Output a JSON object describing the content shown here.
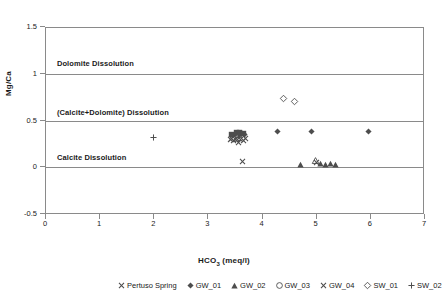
{
  "chart_data": {
    "type": "scatter",
    "title": "",
    "xlabel": "HCO3 (meq/l)",
    "xlabel_base": "HCO",
    "xlabel_sub": "3",
    "xlabel_unit": " (meq/l)",
    "ylabel": "Mg/Ca",
    "xlim": [
      0,
      7
    ],
    "ylim": [
      -0.5,
      1.5
    ],
    "xticks": [
      0,
      1,
      2,
      3,
      4,
      5,
      6,
      7
    ],
    "yticks": [
      -0.5,
      0,
      0.5,
      1,
      1.5
    ],
    "xtick_labels": [
      "0",
      "1",
      "2",
      "3",
      "4",
      "5",
      "6",
      "7"
    ],
    "ytick_labels": [
      "-0.5",
      "0",
      "0.5",
      "1",
      "1.5"
    ],
    "grid": false,
    "reference_lines": [
      {
        "name": "calcite-line",
        "y": 0
      },
      {
        "name": "calcite-dolomite-line",
        "y": 0.5
      },
      {
        "name": "dolomite-line",
        "y": 1.0
      }
    ],
    "annotations": [
      {
        "name": "dolomite-dissolution-label",
        "text": "Dolomite Dissolution",
        "x": 0.22,
        "y": 1.1
      },
      {
        "name": "calcite-dolomite-dissolution-label",
        "text": "(Calcite+Dolomite) Dissolution",
        "x": 0.22,
        "y": 0.58
      },
      {
        "name": "calcite-dissolution-label",
        "text": "Calcite Dissolution",
        "x": 0.22,
        "y": 0.1
      }
    ],
    "legend_position": "bottom",
    "series": [
      {
        "name": "Pertuso Spring",
        "marker": "x",
        "points": [
          {
            "x": 3.42,
            "y": 0.3
          },
          {
            "x": 3.48,
            "y": 0.285
          },
          {
            "x": 3.55,
            "y": 0.295
          },
          {
            "x": 3.58,
            "y": 0.27
          },
          {
            "x": 3.62,
            "y": 0.3
          },
          {
            "x": 3.66,
            "y": 0.285
          },
          {
            "x": 3.64,
            "y": 0.06
          },
          {
            "x": 5.02,
            "y": 0.055
          }
        ]
      },
      {
        "name": "GW_01",
        "marker": "diamond-filled",
        "points": [
          {
            "x": 3.5,
            "y": 0.35
          },
          {
            "x": 3.6,
            "y": 0.345
          },
          {
            "x": 3.68,
            "y": 0.355
          },
          {
            "x": 4.3,
            "y": 0.38
          },
          {
            "x": 4.92,
            "y": 0.38
          },
          {
            "x": 5.98,
            "y": 0.38
          }
        ]
      },
      {
        "name": "GW_02",
        "marker": "triangle-filled",
        "points": [
          {
            "x": 4.72,
            "y": 0.03
          },
          {
            "x": 5.08,
            "y": 0.035
          },
          {
            "x": 5.18,
            "y": 0.03
          },
          {
            "x": 5.28,
            "y": 0.035
          },
          {
            "x": 5.36,
            "y": 0.03
          }
        ]
      },
      {
        "name": "GW_03",
        "marker": "circle-open",
        "points": [
          {
            "x": 3.56,
            "y": 0.365
          },
          {
            "x": 3.62,
            "y": 0.36
          }
        ]
      },
      {
        "name": "GW_04",
        "marker": "x",
        "points": [
          {
            "x": 3.45,
            "y": 0.31
          },
          {
            "x": 3.52,
            "y": 0.3
          },
          {
            "x": 3.7,
            "y": 0.305
          }
        ]
      },
      {
        "name": "SW_01",
        "marker": "diamond-open",
        "points": [
          {
            "x": 4.41,
            "y": 0.73
          },
          {
            "x": 4.6,
            "y": 0.7
          }
        ]
      },
      {
        "name": "SW_02",
        "marker": "plus",
        "points": [
          {
            "x": 2.0,
            "y": 0.32
          },
          {
            "x": 3.57,
            "y": 0.355
          }
        ]
      },
      {
        "name": "SW_03",
        "marker": "square-filled",
        "points": [
          {
            "x": 3.44,
            "y": 0.355
          },
          {
            "x": 3.53,
            "y": 0.375
          },
          {
            "x": 3.59,
            "y": 0.375
          },
          {
            "x": 3.66,
            "y": 0.36
          }
        ]
      },
      {
        "name": "SW_04",
        "marker": "triangle-open",
        "points": [
          {
            "x": 3.57,
            "y": 0.345
          },
          {
            "x": 5.0,
            "y": 0.07
          }
        ]
      }
    ],
    "legend": [
      {
        "label": "Pertuso Spring",
        "marker": "x"
      },
      {
        "label": "GW_01",
        "marker": "diamond-filled"
      },
      {
        "label": "GW_02",
        "marker": "triangle-filled"
      },
      {
        "label": "GW_03",
        "marker": "circle-open"
      },
      {
        "label": "GW_04",
        "marker": "x"
      },
      {
        "label": "SW_01",
        "marker": "diamond-open"
      },
      {
        "label": "SW_02",
        "marker": "plus"
      },
      {
        "label": "SW_03",
        "marker": "square-filled"
      },
      {
        "label": "SW_04",
        "marker": "triangle-open"
      }
    ],
    "colors": {
      "marker": "#4d4d4d",
      "axis": "#8a8a8a",
      "text": "#1a1a1a",
      "background": "#ffffff"
    }
  }
}
